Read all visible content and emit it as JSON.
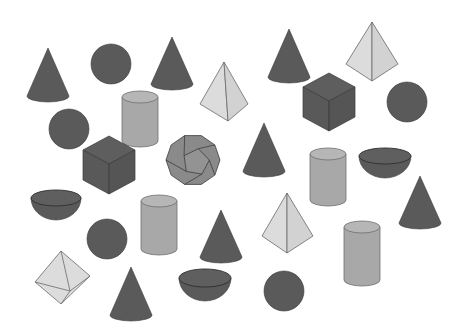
{
  "colors": {
    "background": "#ffffff",
    "dark": "#5a5a5a",
    "dark_edge": "#3a3a3a",
    "mid": "#a8a8a8",
    "mid_top": "#b6b6b6",
    "light": "#dcdcdc",
    "light_edge": "#6a6a6a"
  },
  "shapes": [
    {
      "type": "cone",
      "cx": 48,
      "top": 48,
      "bottom": 96,
      "rx": 21
    },
    {
      "type": "sphere",
      "cx": 111,
      "cy": 64,
      "r": 20
    },
    {
      "type": "cone",
      "cx": 172,
      "top": 37,
      "bottom": 84,
      "rx": 21
    },
    {
      "type": "pyramid",
      "apex": [
        224,
        62
      ],
      "left": [
        200,
        104
      ],
      "right": [
        248,
        104
      ],
      "bottom": [
        228,
        121
      ]
    },
    {
      "type": "cone",
      "cx": 289,
      "top": 29,
      "bottom": 77,
      "rx": 21
    },
    {
      "type": "pyramid",
      "apex": [
        372,
        22
      ],
      "left": [
        346,
        64
      ],
      "right": [
        398,
        64
      ],
      "bottom": [
        372,
        81
      ]
    },
    {
      "type": "cube",
      "cx": 329,
      "cy": 109,
      "s": 26
    },
    {
      "type": "sphere",
      "cx": 407,
      "cy": 102,
      "r": 20
    },
    {
      "type": "sphere",
      "cx": 69,
      "cy": 129,
      "r": 20
    },
    {
      "type": "cylinder",
      "cx": 140,
      "top": 97,
      "bottom": 141,
      "rx": 18
    },
    {
      "type": "dodecahedron",
      "cx": 193,
      "cy": 160,
      "r": 27
    },
    {
      "type": "cone",
      "cx": 264,
      "top": 123,
      "bottom": 171,
      "rx": 21
    },
    {
      "type": "cylinder",
      "cx": 328,
      "top": 154,
      "bottom": 200,
      "rx": 18
    },
    {
      "type": "hemisphere",
      "cx": 385,
      "cy": 156,
      "rx": 26,
      "ry": 8,
      "depth": 22
    },
    {
      "type": "cube",
      "cx": 109,
      "cy": 172,
      "s": 26
    },
    {
      "type": "hemisphere",
      "cx": 56,
      "cy": 198,
      "rx": 25,
      "ry": 8,
      "depth": 22
    },
    {
      "type": "cylinder",
      "cx": 159,
      "top": 201,
      "bottom": 249,
      "rx": 18
    },
    {
      "type": "cone",
      "cx": 221,
      "top": 210,
      "bottom": 257,
      "rx": 21
    },
    {
      "type": "pyramid",
      "apex": [
        287,
        193
      ],
      "left": [
        262,
        236
      ],
      "right": [
        313,
        236
      ],
      "bottom": [
        287,
        253
      ]
    },
    {
      "type": "cone",
      "cx": 420,
      "top": 176,
      "bottom": 223,
      "rx": 21
    },
    {
      "type": "sphere",
      "cx": 107,
      "cy": 239,
      "r": 20
    },
    {
      "type": "cylinder",
      "cx": 362,
      "top": 227,
      "bottom": 280,
      "rx": 18
    },
    {
      "type": "octahedron",
      "top": [
        61,
        251
      ],
      "right": [
        90,
        276
      ],
      "bottom": [
        61,
        304
      ],
      "left": [
        35,
        282
      ],
      "front": [
        70,
        291
      ]
    },
    {
      "type": "cone",
      "cx": 131,
      "top": 267,
      "bottom": 315,
      "rx": 21
    },
    {
      "type": "hemisphere",
      "cx": 205,
      "cy": 278,
      "rx": 26,
      "ry": 9,
      "depth": 23
    },
    {
      "type": "sphere",
      "cx": 284,
      "cy": 291,
      "r": 20
    }
  ]
}
